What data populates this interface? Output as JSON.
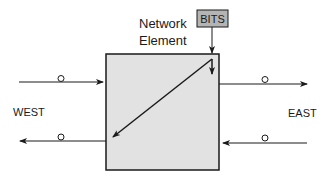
{
  "diagram": {
    "element_label_line1": "Network",
    "element_label_line2": "Element",
    "bits_label": "BITS",
    "west_label": "WEST",
    "east_label": "EAST",
    "colors": {
      "element_fill": "#e2e2e2",
      "bits_fill": "#b4b4b4",
      "stroke": "#1a1a1a"
    }
  }
}
